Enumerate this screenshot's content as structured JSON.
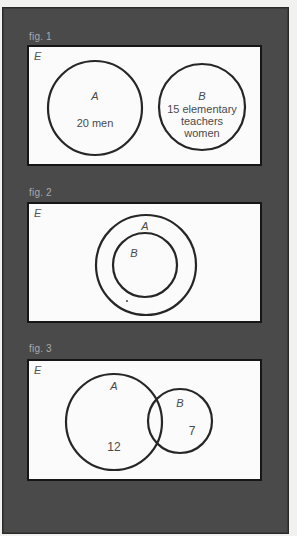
{
  "figures": [
    {
      "label": "fig. 1",
      "universe": "E",
      "circles": [
        {
          "name": "A",
          "cx": 93,
          "cy": 106,
          "r": 47,
          "set_label": "A",
          "content": "20 men"
        },
        {
          "name": "B",
          "cx": 200,
          "cy": 105,
          "r": 43,
          "set_label": "B",
          "content_lines": [
            "15 elementary",
            "teachers",
            "women"
          ]
        }
      ]
    },
    {
      "label": "fig. 2",
      "universe": "E",
      "circles": [
        {
          "name": "A",
          "cx": 144,
          "cy": 263,
          "r": 50,
          "set_label": "A"
        },
        {
          "name": "B",
          "cx": 143,
          "cy": 263,
          "r": 32,
          "set_label": "B"
        }
      ]
    },
    {
      "label": "fig. 3",
      "universe": "E",
      "circles": [
        {
          "name": "A",
          "cx": 112,
          "cy": 420,
          "r": 48,
          "set_label": "A",
          "content": "12"
        },
        {
          "name": "B",
          "cx": 178,
          "cy": 419,
          "r": 32,
          "set_label": "B",
          "content": "7"
        }
      ]
    }
  ],
  "colors": {
    "panel": "#4a4a4a",
    "box": "#fbfbfb",
    "stroke": "#262626",
    "text": "#4a4a4a"
  }
}
